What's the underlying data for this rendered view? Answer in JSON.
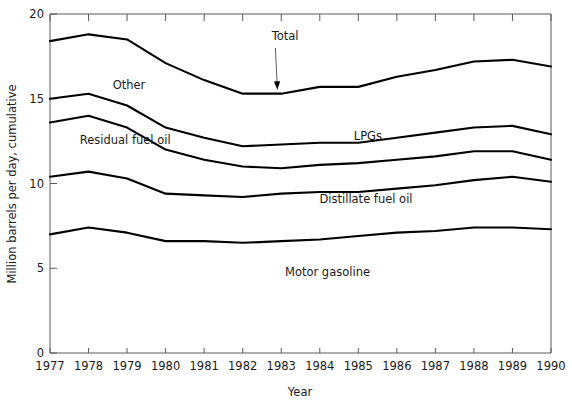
{
  "chart_data": {
    "type": "line",
    "title": "",
    "subtitle": "",
    "xlabel": "Year",
    "ylabel": "Million barrels per day, cumulative",
    "x": [
      1977,
      1978,
      1979,
      1980,
      1981,
      1982,
      1983,
      1984,
      1985,
      1986,
      1987,
      1988,
      1989,
      1990
    ],
    "xlim": [
      1977,
      1990
    ],
    "ylim": [
      0,
      20
    ],
    "xticks": [
      "1977",
      "1978",
      "1979",
      "1980",
      "1981",
      "1982",
      "1983",
      "1984",
      "1985",
      "1986",
      "1987",
      "1988",
      "1989",
      "1990"
    ],
    "yticks": [
      "0",
      "5",
      "10",
      "15",
      "20"
    ],
    "grid": false,
    "legend_position": "inline-band-labels",
    "line_color": "#000000",
    "axis_color": "#5a5a5a",
    "note": "Cumulative (stacked) boundary lines; each series value is the running total up to and including that component.",
    "series": [
      {
        "name": "Total",
        "label": "Total",
        "label_kind": "annotation-arrow",
        "values": [
          18.4,
          18.8,
          18.5,
          17.1,
          16.1,
          15.3,
          15.3,
          15.7,
          15.7,
          16.3,
          16.7,
          17.2,
          17.3,
          16.9
        ]
      },
      {
        "name": "Other",
        "label": "Other",
        "label_kind": "band",
        "values": [
          15.0,
          15.3,
          14.6,
          13.3,
          12.7,
          12.2,
          12.3,
          12.4,
          12.4,
          12.7,
          13.0,
          13.3,
          13.4,
          12.9
        ]
      },
      {
        "name": "LPGs",
        "label": "LPGs",
        "label_kind": "band",
        "values": [
          13.6,
          14.0,
          13.3,
          12.0,
          11.4,
          11.0,
          10.9,
          11.1,
          11.2,
          11.4,
          11.6,
          11.9,
          11.9,
          11.4
        ]
      },
      {
        "name": "Residual fuel oil",
        "label": "Residual fuel oil",
        "label_kind": "band",
        "values": [
          10.4,
          10.7,
          10.3,
          9.4,
          9.3,
          9.2,
          9.4,
          9.5,
          9.5,
          9.7,
          9.9,
          10.2,
          10.4,
          10.1
        ]
      },
      {
        "name": "Distillate fuel oil",
        "label": "Distillate fuel oil",
        "label_kind": "band",
        "values": [
          7.0,
          7.4,
          7.1,
          6.6,
          6.6,
          6.5,
          6.6,
          6.7,
          6.9,
          7.1,
          7.2,
          7.4,
          7.4,
          7.3
        ]
      },
      {
        "name": "Motor gasoline",
        "label": "Motor gasoline",
        "label_kind": "band",
        "values": [
          0,
          0,
          0,
          0,
          0,
          0,
          0,
          0,
          0,
          0,
          0,
          0,
          0,
          0
        ]
      }
    ],
    "band_labels": [
      {
        "text": "Other",
        "x": 1979.05,
        "y": 15.55
      },
      {
        "text": "Residual fuel oil",
        "x": 1978.95,
        "y": 12.35
      },
      {
        "text": "LPGs",
        "x": 1985.25,
        "y": 12.55
      },
      {
        "text": "Distillate fuel oil",
        "x": 1985.2,
        "y": 8.85
      },
      {
        "text": "Motor gasoline",
        "x": 1984.2,
        "y": 4.55
      }
    ],
    "annotations": [
      {
        "text": "Total",
        "text_x": 1983.1,
        "text_y": 18.45,
        "arrow_from_x": 1982.85,
        "arrow_from_y": 18.0,
        "arrow_to_x": 1982.9,
        "arrow_to_y": 15.55
      }
    ]
  }
}
